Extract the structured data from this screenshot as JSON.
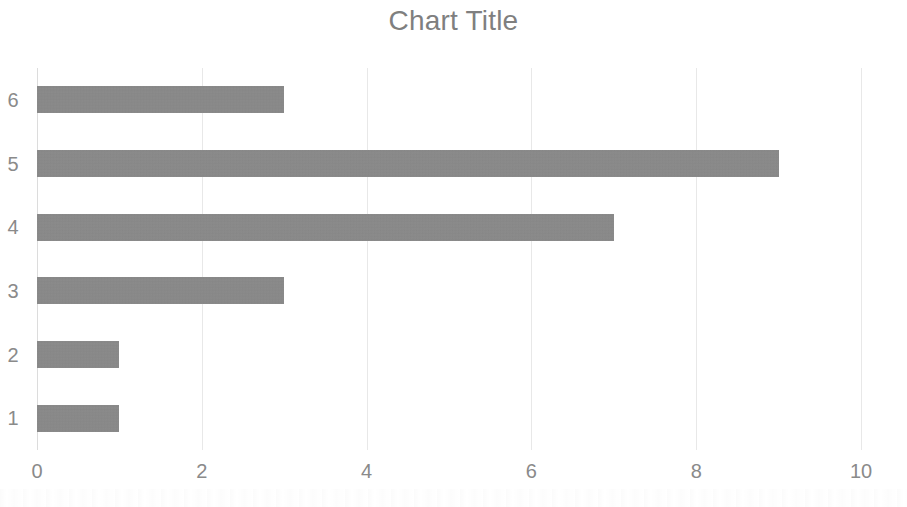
{
  "chart_data": {
    "type": "bar",
    "orientation": "horizontal",
    "title": "Chart Title",
    "xlabel": "",
    "ylabel": "",
    "categories": [
      "1",
      "2",
      "3",
      "4",
      "5",
      "6"
    ],
    "values": [
      1,
      1,
      3,
      7,
      9,
      3
    ],
    "category_order_top_to_bottom": [
      "6",
      "5",
      "4",
      "3",
      "2",
      "1"
    ],
    "xlim": [
      0,
      10
    ],
    "x_ticks": [
      "0",
      "2",
      "4",
      "6",
      "8",
      "10"
    ],
    "x_tick_values": [
      0,
      2,
      4,
      6,
      8,
      10
    ],
    "y_ticks": [
      "6",
      "5",
      "4",
      "3",
      "2",
      "1"
    ],
    "grid": true,
    "grid_axis": "x",
    "legend": false,
    "legend_position": "none",
    "series": [
      {
        "name": "",
        "values": [
          1,
          1,
          3,
          7,
          9,
          3
        ]
      }
    ],
    "bars": [
      {
        "category": "6",
        "value": 3
      },
      {
        "category": "5",
        "value": 9
      },
      {
        "category": "4",
        "value": 7
      },
      {
        "category": "3",
        "value": 3
      },
      {
        "category": "2",
        "value": 1
      },
      {
        "category": "1",
        "value": 1
      }
    ],
    "colors": {
      "bar": "#858585",
      "title": "#7f7f7f",
      "tick_label": "#8a8a8a",
      "gridline": "#e8e8e8",
      "axis_line": "#dcdcdc",
      "background": "#ffffff"
    }
  }
}
